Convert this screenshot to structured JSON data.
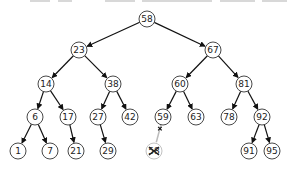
{
  "diagram": {
    "type": "binary-search-tree",
    "colors": {
      "edge": "#111111",
      "node_stroke": "#333333",
      "node_fill": "#ffffff",
      "text": "#222222",
      "deleted": "#bbbbbb"
    },
    "nodes": [
      {
        "id": "n58",
        "label": "58",
        "x": 147,
        "y": 19
      },
      {
        "id": "n23",
        "label": "23",
        "x": 79,
        "y": 50
      },
      {
        "id": "n67",
        "label": "67",
        "x": 213,
        "y": 50
      },
      {
        "id": "n14",
        "label": "14",
        "x": 46,
        "y": 84
      },
      {
        "id": "n38",
        "label": "38",
        "x": 113,
        "y": 84
      },
      {
        "id": "n60",
        "label": "60",
        "x": 180,
        "y": 84
      },
      {
        "id": "n81",
        "label": "81",
        "x": 244,
        "y": 84
      },
      {
        "id": "n6",
        "label": "6",
        "x": 35,
        "y": 117
      },
      {
        "id": "n17",
        "label": "17",
        "x": 68,
        "y": 117
      },
      {
        "id": "n27",
        "label": "27",
        "x": 98,
        "y": 117
      },
      {
        "id": "n42",
        "label": "42",
        "x": 130,
        "y": 117
      },
      {
        "id": "n59",
        "label": "59",
        "x": 163,
        "y": 117
      },
      {
        "id": "n63",
        "label": "63",
        "x": 196,
        "y": 117
      },
      {
        "id": "n78",
        "label": "78",
        "x": 229,
        "y": 117
      },
      {
        "id": "n92",
        "label": "92",
        "x": 262,
        "y": 117
      },
      {
        "id": "n1",
        "label": "1",
        "x": 18,
        "y": 151
      },
      {
        "id": "n7",
        "label": "7",
        "x": 50,
        "y": 151
      },
      {
        "id": "n21",
        "label": "21",
        "x": 76,
        "y": 151
      },
      {
        "id": "n29",
        "label": "29",
        "x": 108,
        "y": 151
      },
      {
        "id": "n58del",
        "label": "58",
        "x": 154,
        "y": 151,
        "deleted": true
      },
      {
        "id": "n91",
        "label": "91",
        "x": 249,
        "y": 151
      },
      {
        "id": "n95",
        "label": "95",
        "x": 272,
        "y": 151
      }
    ],
    "edges": [
      {
        "from": "n58",
        "to": "n23"
      },
      {
        "from": "n58",
        "to": "n67"
      },
      {
        "from": "n23",
        "to": "n14"
      },
      {
        "from": "n23",
        "to": "n38"
      },
      {
        "from": "n67",
        "to": "n60"
      },
      {
        "from": "n67",
        "to": "n81"
      },
      {
        "from": "n14",
        "to": "n6"
      },
      {
        "from": "n14",
        "to": "n17"
      },
      {
        "from": "n38",
        "to": "n27"
      },
      {
        "from": "n38",
        "to": "n42"
      },
      {
        "from": "n60",
        "to": "n59"
      },
      {
        "from": "n60",
        "to": "n63"
      },
      {
        "from": "n81",
        "to": "n78"
      },
      {
        "from": "n81",
        "to": "n92"
      },
      {
        "from": "n6",
        "to": "n1"
      },
      {
        "from": "n6",
        "to": "n7"
      },
      {
        "from": "n17",
        "to": "n21"
      },
      {
        "from": "n27",
        "to": "n29"
      },
      {
        "from": "n59",
        "to": "n58del",
        "deleted": true
      },
      {
        "from": "n92",
        "to": "n91"
      },
      {
        "from": "n92",
        "to": "n95"
      }
    ]
  }
}
